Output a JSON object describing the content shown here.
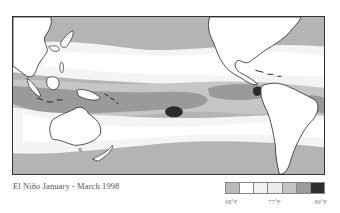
{
  "caption": "El Niño January - March 1998",
  "legend": {
    "swatch_colors": [
      "#b9b9b9",
      "#ffffff",
      "#f2f2f2",
      "#ececec",
      "#c4c4c4",
      "#9c9c9c",
      "#2e2e2e"
    ],
    "labels": [
      "68°F",
      "77°F",
      "86°F"
    ]
  },
  "map": {
    "description": "Pacific Ocean sea surface temperature during El Niño, showing Asia, Australia, and the Americas",
    "band_colors": {
      "cool": "#b4b4b4",
      "light": "#f4f4f4",
      "white": "#ffffff",
      "mid": "#c6c6c6",
      "warm": "#9a9a9a",
      "hottest": "#2b2b2b",
      "land": "#ffffff",
      "coast": "#222222"
    }
  }
}
